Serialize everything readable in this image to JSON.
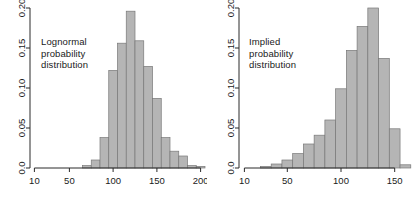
{
  "figure": {
    "background": "#ffffff",
    "bar_fill": "#b5b5b5",
    "bar_stroke": "#787878",
    "axis_color": "#2b2b2b",
    "text_color": "#1a1a1a"
  },
  "panels": [
    {
      "id": "lognormal",
      "annotation_lines": [
        "Lognormal",
        "probability",
        "distribution"
      ]
    },
    {
      "id": "implied",
      "annotation_lines": [
        "Implied",
        "probability",
        "distribution"
      ]
    }
  ],
  "chart_data": [
    {
      "type": "bar",
      "title": "Lognormal probability distribution",
      "xlabel": "",
      "ylabel": "",
      "xlim": [
        5,
        205
      ],
      "ylim": [
        0.0,
        0.2
      ],
      "xticks": [
        10,
        50,
        100,
        150,
        200
      ],
      "xtick_labels": [
        "10",
        "50",
        "100",
        "150",
        "200"
      ],
      "yticks": [
        0.0,
        0.05,
        0.1,
        0.15,
        0.2
      ],
      "ytick_labels": [
        "0.0",
        "0.05",
        "0.10",
        "0.15",
        "0.20"
      ],
      "grid": false,
      "legend": "none",
      "bin_width": 10,
      "bin_starts": [
        55,
        65,
        75,
        85,
        95,
        105,
        115,
        125,
        135,
        145,
        155,
        165,
        175,
        185,
        195
      ],
      "categories": [
        "55-65",
        "65-75",
        "75-85",
        "85-95",
        "95-105",
        "105-115",
        "115-125",
        "125-135",
        "135-145",
        "145-155",
        "155-165",
        "165-175",
        "175-185",
        "185-195",
        "195-205"
      ],
      "values": [
        0.0,
        0.003,
        0.01,
        0.038,
        0.122,
        0.156,
        0.196,
        0.159,
        0.127,
        0.087,
        0.038,
        0.021,
        0.015,
        0.003,
        0.002
      ]
    },
    {
      "type": "bar",
      "title": "Implied probability distribution",
      "xlabel": "",
      "ylabel": "",
      "xlim": [
        5,
        168
      ],
      "ylim": [
        0.0,
        0.2
      ],
      "xticks": [
        10,
        50,
        100,
        150
      ],
      "xtick_labels": [
        "10",
        "50",
        "100",
        "150"
      ],
      "yticks": [
        0.0,
        0.05,
        0.1,
        0.15,
        0.2
      ],
      "ytick_labels": [
        "0.0",
        "0.05",
        "0.10",
        "0.15",
        "0.20"
      ],
      "grid": false,
      "legend": "none",
      "bin_width": 10,
      "bin_starts": [
        15,
        25,
        35,
        45,
        55,
        65,
        75,
        85,
        95,
        105,
        115,
        125,
        135,
        145,
        155
      ],
      "categories": [
        "15-25",
        "25-35",
        "35-45",
        "45-55",
        "55-65",
        "65-75",
        "75-85",
        "85-95",
        "95-105",
        "105-115",
        "115-125",
        "125-135",
        "135-145",
        "145-155",
        "155-165"
      ],
      "values": [
        0.0,
        0.002,
        0.005,
        0.01,
        0.018,
        0.03,
        0.041,
        0.06,
        0.099,
        0.147,
        0.177,
        0.2,
        0.137,
        0.049,
        0.004
      ]
    }
  ]
}
